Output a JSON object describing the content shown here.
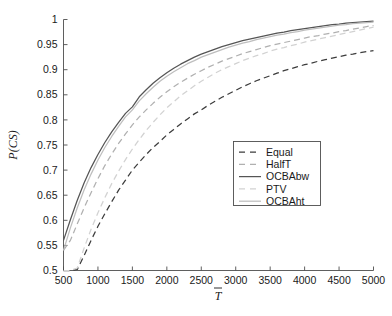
{
  "chart_data": {
    "type": "line",
    "title": "",
    "xlabel": "T̅",
    "ylabel": "P(CS)",
    "xlim": [
      500,
      5000
    ],
    "ylim": [
      0.5,
      1.0
    ],
    "xticks": [
      500,
      1000,
      1500,
      2000,
      2500,
      3000,
      3500,
      4000,
      4500,
      5000
    ],
    "xtick_labels": [
      "500",
      "1000",
      "1500",
      "2000",
      "2500",
      "3000",
      "3500",
      "4000",
      "4500",
      "5000"
    ],
    "yticks": [
      0.5,
      0.55,
      0.6,
      0.65,
      0.7,
      0.75,
      0.8,
      0.85,
      0.9,
      0.95,
      1
    ],
    "ytick_labels": [
      "0.5",
      "0.55",
      "0.6",
      "0.65",
      "0.7",
      "0.75",
      "0.8",
      "0.85",
      "0.9",
      "0.95",
      "1"
    ],
    "grid": false,
    "legend_position": "center-right",
    "x": [
      500,
      600,
      700,
      800,
      900,
      1000,
      1100,
      1200,
      1300,
      1400,
      1500,
      1600,
      1700,
      1800,
      1900,
      2000,
      2100,
      2200,
      2300,
      2400,
      2500,
      2600,
      2700,
      2800,
      2900,
      3000,
      3100,
      3200,
      3300,
      3400,
      3500,
      3600,
      3700,
      3800,
      3900,
      4000,
      4100,
      4200,
      4300,
      4400,
      4500,
      4600,
      4700,
      4800,
      4900,
      5000
    ],
    "series": [
      {
        "name": "Equal",
        "style": "dashed",
        "color": "#3c3c3c",
        "values": [
          0.5,
          0.5,
          0.502,
          0.53,
          0.56,
          0.588,
          0.613,
          0.637,
          0.66,
          0.68,
          0.7,
          0.716,
          0.731,
          0.745,
          0.757,
          0.77,
          0.781,
          0.792,
          0.802,
          0.812,
          0.82,
          0.829,
          0.837,
          0.845,
          0.852,
          0.859,
          0.866,
          0.872,
          0.878,
          0.883,
          0.888,
          0.893,
          0.898,
          0.902,
          0.906,
          0.91,
          0.913,
          0.917,
          0.92,
          0.923,
          0.926,
          0.929,
          0.931,
          0.934,
          0.936,
          0.938
        ]
      },
      {
        "name": "HalfT",
        "style": "dashed",
        "color": "#b0b0b0",
        "values": [
          0.54,
          0.56,
          0.593,
          0.625,
          0.655,
          0.683,
          0.709,
          0.732,
          0.753,
          0.772,
          0.79,
          0.806,
          0.82,
          0.833,
          0.845,
          0.856,
          0.866,
          0.875,
          0.883,
          0.891,
          0.898,
          0.905,
          0.911,
          0.917,
          0.922,
          0.927,
          0.932,
          0.936,
          0.94,
          0.944,
          0.948,
          0.951,
          0.954,
          0.957,
          0.96,
          0.963,
          0.966,
          0.968,
          0.971,
          0.973,
          0.976,
          0.978,
          0.981,
          0.983,
          0.986,
          0.988
        ]
      },
      {
        "name": "OCBAbw",
        "style": "solid",
        "color": "#555555",
        "values": [
          0.56,
          0.601,
          0.64,
          0.675,
          0.705,
          0.731,
          0.755,
          0.776,
          0.795,
          0.813,
          0.826,
          0.846,
          0.86,
          0.873,
          0.884,
          0.894,
          0.903,
          0.911,
          0.918,
          0.925,
          0.931,
          0.936,
          0.941,
          0.946,
          0.95,
          0.954,
          0.958,
          0.961,
          0.964,
          0.967,
          0.97,
          0.973,
          0.975,
          0.978,
          0.98,
          0.982,
          0.984,
          0.986,
          0.988,
          0.99,
          0.991,
          0.993,
          0.994,
          0.995,
          0.996,
          0.997
        ]
      },
      {
        "name": "PTV",
        "style": "dashed",
        "color": "#d2d2d2",
        "values": [
          0.5,
          0.5,
          0.505,
          0.545,
          0.582,
          0.615,
          0.645,
          0.673,
          0.698,
          0.721,
          0.742,
          0.761,
          0.779,
          0.795,
          0.81,
          0.824,
          0.836,
          0.848,
          0.858,
          0.868,
          0.877,
          0.885,
          0.893,
          0.9,
          0.906,
          0.912,
          0.918,
          0.923,
          0.928,
          0.932,
          0.937,
          0.941,
          0.944,
          0.948,
          0.951,
          0.955,
          0.958,
          0.961,
          0.964,
          0.967,
          0.97,
          0.973,
          0.976,
          0.979,
          0.982,
          0.985
        ]
      },
      {
        "name": "OCBAht",
        "style": "solid",
        "color": "#bebebe",
        "values": [
          0.54,
          0.585,
          0.625,
          0.661,
          0.692,
          0.72,
          0.745,
          0.767,
          0.787,
          0.806,
          0.82,
          0.838,
          0.852,
          0.865,
          0.877,
          0.887,
          0.896,
          0.904,
          0.912,
          0.918,
          0.925,
          0.93,
          0.935,
          0.94,
          0.945,
          0.949,
          0.953,
          0.956,
          0.96,
          0.963,
          0.966,
          0.969,
          0.971,
          0.974,
          0.976,
          0.979,
          0.981,
          0.983,
          0.985,
          0.987,
          0.989,
          0.99,
          0.992,
          0.993,
          0.994,
          0.995
        ]
      }
    ],
    "legend": [
      {
        "label": "Equal",
        "style": "dashed",
        "color": "#3c3c3c"
      },
      {
        "label": "HalfT",
        "style": "dashed",
        "color": "#b0b0b0"
      },
      {
        "label": "OCBAbw",
        "style": "solid",
        "color": "#555555"
      },
      {
        "label": "PTV",
        "style": "dashed",
        "color": "#d2d2d2"
      },
      {
        "label": "OCBAht",
        "style": "solid",
        "color": "#bebebe"
      }
    ]
  }
}
